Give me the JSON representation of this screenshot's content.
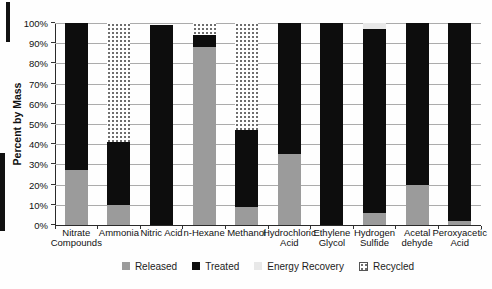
{
  "chart_data": {
    "type": "bar",
    "stacked": true,
    "title": "",
    "ylabel": "Percent by Mass",
    "xlabel": "",
    "ylim": [
      0,
      100
    ],
    "grid": true,
    "legend_position": "bottom",
    "yticks": [
      "0%",
      "10%",
      "20%",
      "30%",
      "40%",
      "50%",
      "60%",
      "70%",
      "80%",
      "90%",
      "100%"
    ],
    "categories": [
      "Nitrate Compounds",
      "Ammonia",
      "Nitric Acid",
      "n-Hexane",
      "Methanol",
      "Hydrochloric Acid",
      "Ethylene Glycol",
      "Hydrogen Sulfide",
      "Acetal dehyde",
      "Peroxyacetic Acid"
    ],
    "category_lines": [
      [
        "Nitrate",
        "Compounds"
      ],
      [
        "Ammonia"
      ],
      [
        "Nitric Acid"
      ],
      [
        "n-Hexane"
      ],
      [
        "Methanol"
      ],
      [
        "Hydrochloric",
        "Acid"
      ],
      [
        "Ethylene",
        "Glycol"
      ],
      [
        "Hydrogen",
        "Sulfide"
      ],
      [
        "Acetal",
        "dehyde"
      ],
      [
        "Peroxyacetic",
        "Acid"
      ]
    ],
    "series": [
      {
        "name": "Released",
        "color": "#9b9b9b",
        "pattern": "solid",
        "values": [
          27,
          10,
          0,
          88,
          9,
          35,
          0,
          6,
          20,
          2
        ]
      },
      {
        "name": "Treated",
        "color": "#0d0d0d",
        "pattern": "solid",
        "values": [
          73,
          31,
          99,
          6,
          38,
          65,
          100,
          91,
          80,
          98
        ]
      },
      {
        "name": "Energy Recovery",
        "color": "#e8e8e8",
        "pattern": "solid",
        "values": [
          0,
          0,
          0,
          0,
          0,
          0,
          0,
          3,
          0,
          0
        ]
      },
      {
        "name": "Recycled",
        "color": "#ffffff",
        "pattern": "dots",
        "dot_color": "#6e6e6e",
        "values": [
          0,
          59,
          0,
          6,
          53,
          0,
          0,
          0,
          0,
          0
        ]
      }
    ],
    "legend": [
      "Released",
      "Treated",
      "Energy Recovery",
      "Recycled"
    ]
  },
  "colors": {
    "gridline": "#ababab",
    "axis": "#2a2a2a",
    "text": "#1c1c1c"
  }
}
